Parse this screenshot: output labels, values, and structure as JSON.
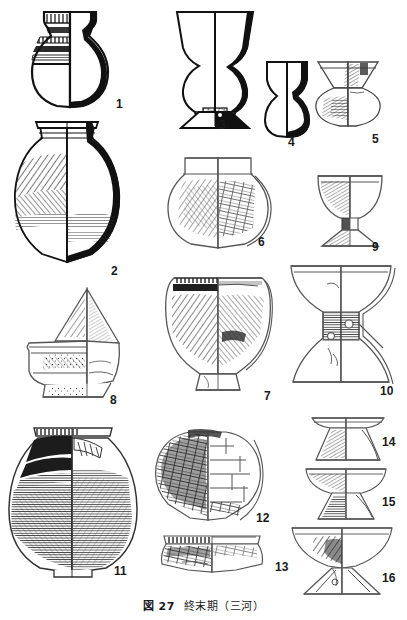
{
  "figure": {
    "caption_label": "図 27",
    "caption_title": "終末期",
    "caption_region": "（三河）",
    "caption_full": "図 27　終末期（三河）",
    "page_background": "#ffffff",
    "ink_color": "#1a1a1a",
    "plate_type": "archaeological pottery typology plate",
    "item_count": 16
  },
  "items": [
    {
      "number": "1",
      "label_x": 116,
      "label_y": 98,
      "name": "jar-with-flared-rim",
      "description": "Globular jar with everted flaring rim and banded comb/incised decoration on shoulder; left half shows surface decoration, right half shows solid black profile section.",
      "column": "left",
      "line_weight": "heavy"
    },
    {
      "number": "2",
      "number_x": 111,
      "number_y": 265,
      "name": "large-globular-jar-narrow-neck",
      "description": "Large round-bodied jar with short narrow neck and flat everted rim; dense diagonal burnish hatching on left body, solid black section profile on right.",
      "column": "left",
      "line_weight": "heavy"
    },
    {
      "number": "3",
      "number_x": 219,
      "number_y": 122,
      "name": "tall-pedestal-cup",
      "description": "Tall hourglass-profile pedestal cup with wide flaring mouth, constricted waist, bulbous lower body and splayed foot; black section on right.",
      "column": "middle",
      "line_weight": "heavy"
    },
    {
      "number": "4",
      "number_x": 288,
      "number_y": 138,
      "name": "small-waisted-cup",
      "description": "Small waisted vessel, flaring rim with constricted upper body and rounded lower body; black section on right edge.",
      "column": "middle",
      "line_weight": "heavy"
    },
    {
      "number": "5",
      "number_x": 374,
      "number_y": 135,
      "name": "small-flared-rim-vessel",
      "description": "Small vessel with widely flaring rim over a squat lenticular body; hatched surface treatment.",
      "column": "right",
      "line_weight": "light"
    },
    {
      "number": "6",
      "number_x": 258,
      "number_y": 238,
      "name": "globular-jar-short-neck",
      "description": "Globular jar with short upright neck; left half shaded with fine hatching, right half shows scraped/paddled facets.",
      "column": "middle",
      "line_weight": "light"
    },
    {
      "number": "7",
      "number_x": 265,
      "number_y": 392,
      "name": "pedestal-bowl",
      "description": "Deep pedestal-footed bowl with dark banded rim and heavily hatched body; low splayed foot.",
      "column": "middle",
      "line_weight": "light"
    },
    {
      "number": "8",
      "number_x": 112,
      "number_y": 397,
      "name": "spouted-peaked-vessel",
      "description": "Vessel with tall pointed peaked upper section over a cylindrical lower body with projecting spout; hatched surfaces throughout.",
      "column": "left",
      "line_weight": "light"
    },
    {
      "number": "9",
      "number_x": 374,
      "number_y": 243,
      "name": "stemmed-cup",
      "description": "Stemmed cup with deep rounded bowl on a short flaring pedestal foot.",
      "column": "right",
      "line_weight": "light"
    },
    {
      "number": "10",
      "number_x": 382,
      "number_y": 388,
      "name": "large-perforated-pedestal-stand",
      "description": "Large hourglass pedestal stand with wide flaring upper bowl, dark hatched perforated waist with circular cut-outs, and broad splayed base.",
      "column": "right",
      "line_weight": "light"
    },
    {
      "number": "11",
      "number_x": 116,
      "number_y": 568,
      "name": "large-round-jar-dark-surface",
      "description": "Large round-bodied jar with short collar rim; entire body covered with dense horizontal smoothing/burnish striations rendered very dark.",
      "column": "left",
      "line_weight": "heavy"
    },
    {
      "number": "12",
      "number_x": 258,
      "number_y": 515,
      "name": "globular-jar-paddled",
      "description": "Globular jar with paddle-and-anvil faceted surface; left half dark hatched, right half showing outline of facet scars.",
      "column": "middle",
      "line_weight": "light"
    },
    {
      "number": "13",
      "number_x": 277,
      "number_y": 564,
      "name": "rim-sherd-fragment",
      "description": "Rim fragment of a wide-mouthed vessel with notched/serrated rim band and hatched shoulder.",
      "column": "middle",
      "line_weight": "light"
    },
    {
      "number": "14",
      "number_x": 384,
      "number_y": 440,
      "name": "small-stemmed-dish",
      "description": "Small stemmed dish with shallow flat plate on a short conical hatched foot.",
      "column": "right",
      "line_weight": "light"
    },
    {
      "number": "15",
      "number_x": 384,
      "number_y": 500,
      "name": "stemmed-bowl",
      "description": "Stemmed bowl with shallow rounded bowl on a flaring hatched pedestal foot.",
      "column": "right",
      "line_weight": "light"
    },
    {
      "number": "16",
      "number_x": 384,
      "number_y": 576,
      "name": "large-stemmed-dish",
      "description": "Large stemmed dish with wide shallow bowl on a tall flaring pedestal with perforations.",
      "column": "right",
      "line_weight": "light"
    }
  ]
}
